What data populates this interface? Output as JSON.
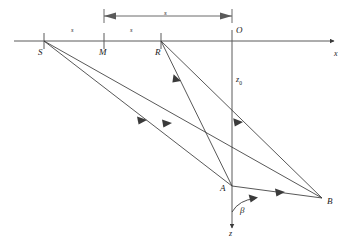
{
  "figure": {
    "type": "ray-path-geometry-diagram",
    "background_color": "#ffffff",
    "line_color": "#3a3a3a",
    "text_color": "#1a1a1a"
  },
  "labels": {
    "source": "S",
    "midpoint": "M",
    "receiver": "R",
    "origin": "O",
    "scatterer_a": "A",
    "scatterer_b": "B",
    "x_axis": "x",
    "z_axis": "z",
    "depth": "z",
    "depth_subscript": "0",
    "angle": "β",
    "segment_sm": "s",
    "segment_mr": "s",
    "dimension_mo": "s"
  },
  "geometry": {
    "axis_y": 41,
    "points": {
      "S": [
        44,
        41
      ],
      "M": [
        104,
        41
      ],
      "R": [
        161,
        41
      ],
      "O": [
        232,
        41
      ],
      "A": [
        232,
        186
      ],
      "B": [
        322,
        198
      ]
    },
    "x_axis_end": [
      334,
      41
    ],
    "z_axis_end": [
      232,
      228
    ],
    "dimension_line": {
      "y": 16,
      "x1": 104,
      "x2": 232
    },
    "angle_arc": {
      "vertex": [
        232,
        186
      ],
      "radius": 26,
      "label_pos": [
        240,
        212
      ]
    }
  },
  "rays": [
    {
      "name": "S-to-A",
      "from": "S",
      "to": "A",
      "arrow_at": 0.52
    },
    {
      "name": "S-to-B",
      "from": "S",
      "to": "B",
      "arrow_at": 0.46
    },
    {
      "name": "R-to-A",
      "from": "R",
      "to": "A",
      "arrow_at": 0.27
    },
    {
      "name": "R-to-B",
      "from": "R",
      "to": "B",
      "arrow_at": 0.44
    },
    {
      "name": "A-to-B",
      "from": "A",
      "to": "B",
      "arrow_at": 0.5
    }
  ]
}
